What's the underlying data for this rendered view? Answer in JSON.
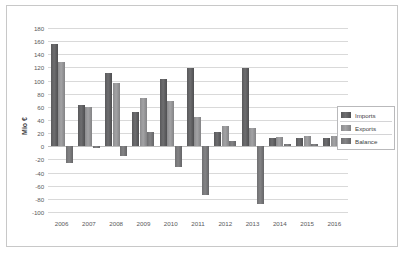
{
  "chart_data": {
    "type": "bar",
    "title": "",
    "xlabel": "",
    "ylabel": "Mio €",
    "ylim": [
      -100,
      180
    ],
    "ytick_step": 20,
    "grid": true,
    "legend_position": "right",
    "categories": [
      "2006",
      "2007",
      "2008",
      "2009",
      "2010",
      "2011",
      "2012",
      "2013",
      "2014",
      "2015",
      "2016"
    ],
    "yticks": [
      "180",
      "160",
      "140",
      "120",
      "100",
      "80",
      "60",
      "40",
      "20",
      "0",
      "-20",
      "-40",
      "-60",
      "-80",
      "-100"
    ],
    "series": [
      {
        "name": "Imports",
        "color": "#59595b",
        "values": [
          155,
          63,
          112,
          52,
          102,
          119,
          22,
          119,
          12,
          13,
          12
        ]
      },
      {
        "name": "Exports",
        "color": "#8c8c8e",
        "values": [
          128,
          60,
          96,
          74,
          69,
          45,
          31,
          28,
          14,
          16,
          15
        ]
      },
      {
        "name": "Balance",
        "color": "#6f6f71",
        "values": [
          -26,
          -3,
          -15,
          22,
          -32,
          -74,
          8,
          -88,
          3,
          3,
          3
        ]
      }
    ]
  }
}
